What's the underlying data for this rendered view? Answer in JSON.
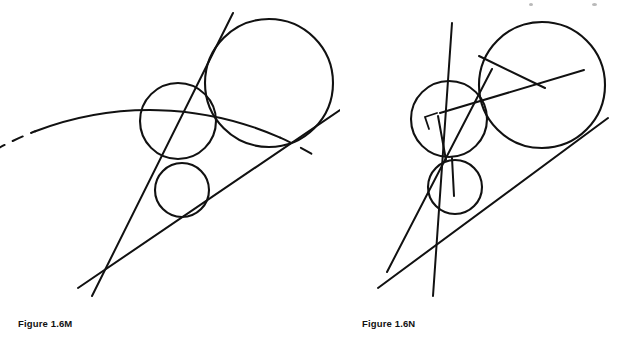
{
  "page": {
    "width": 621,
    "height": 357,
    "background": "#ffffff",
    "ink_color": "#111111"
  },
  "figures": [
    {
      "id": "figure-1-6-m",
      "caption": "Figure 1.6M",
      "description": "Two tangent lines from an external point with three inscribed circles and a large circular arc partially dashed",
      "elements": {
        "vertex": {
          "x": 108,
          "y": 273
        },
        "line_steep": {
          "x1": 233,
          "y1": 13,
          "x2": 92,
          "y2": 296
        },
        "line_shallow": {
          "x1": 340,
          "y1": 110,
          "x2": 78,
          "y2": 288
        },
        "circle_large": {
          "cx": 269,
          "cy": 83,
          "r": 64
        },
        "circle_medium": {
          "cx": 178,
          "cy": 121,
          "r": 38
        },
        "circle_small": {
          "cx": 182,
          "cy": 190,
          "r": 27
        },
        "arc": {
          "cx": 150,
          "cy": 430,
          "r": 320,
          "solid_from_deg": 249,
          "solid_to_deg": 294,
          "dashed_head_from_deg": 241,
          "dashed_head_to_deg": 249,
          "dashed_tail_from_deg": 294,
          "dashed_tail_to_deg": 302
        }
      }
    },
    {
      "id": "figure-1-6-n",
      "caption": "Figure 1.6N",
      "description": "Same tangent-line construction with radii drawn to the points of tangency and a right angle marker",
      "elements": {
        "vertex": {
          "x": 47,
          "y": 272
        },
        "line_steep": {
          "x1": 93,
          "y1": 296,
          "x2": 112,
          "y2": 23
        },
        "line_shallow": {
          "x1": 38,
          "y1": 288,
          "x2": 268,
          "y2": 118
        },
        "circle_large": {
          "cx": 202,
          "cy": 85,
          "r": 63
        },
        "circle_medium": {
          "cx": 109,
          "cy": 119,
          "r": 38
        },
        "circle_small": {
          "cx": 115,
          "cy": 187,
          "r": 27
        },
        "radius_large_a": {
          "x1": 202,
          "y1": 85,
          "x2": 141,
          "y2": 58
        },
        "radius_large_b": {
          "x1": 202,
          "y1": 85,
          "x2": 244,
          "y2": 70
        },
        "radius_medium": {
          "x1": 109,
          "y1": 119,
          "x2": 107,
          "y2": 157
        },
        "radius_small": {
          "x1": 115,
          "y1": 187,
          "x2": 113,
          "y2": 160
        },
        "right_angle_marker": {
          "points": "97,113 85,117 89,129"
        }
      }
    }
  ],
  "artifacts": {
    "label": "scanner specks",
    "specks": [
      {
        "x": 299,
        "y": 302,
        "w": 3,
        "h": 7
      },
      {
        "x": 529,
        "y": 3,
        "w": 4,
        "h": 3
      },
      {
        "x": 592,
        "y": 3,
        "w": 5,
        "h": 3
      }
    ]
  }
}
